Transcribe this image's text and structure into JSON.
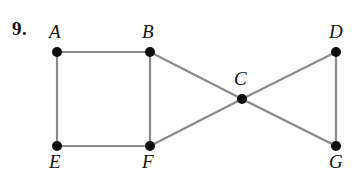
{
  "problem": {
    "number_label": "9."
  },
  "figure": {
    "type": "undirected-graph",
    "background_color": "#ffffff",
    "edge_color": "#8a8a8a",
    "vertex_color": "#0d0d0d",
    "label_color": "#111111",
    "vertex_radius": 5,
    "vertices": [
      {
        "id": "A",
        "label": "A",
        "x": 57,
        "y": 52,
        "label_x": 49,
        "label_y": 38
      },
      {
        "id": "B",
        "label": "B",
        "x": 150,
        "y": 52,
        "label_x": 142,
        "label_y": 38
      },
      {
        "id": "C",
        "label": "C",
        "x": 242,
        "y": 99,
        "label_x": 234,
        "label_y": 85
      },
      {
        "id": "D",
        "label": "D",
        "x": 336,
        "y": 52,
        "label_x": 329,
        "label_y": 38
      },
      {
        "id": "E",
        "label": "E",
        "x": 57,
        "y": 146,
        "label_x": 49,
        "label_y": 168
      },
      {
        "id": "F",
        "label": "F",
        "x": 150,
        "y": 146,
        "label_x": 142,
        "label_y": 168
      },
      {
        "id": "G",
        "label": "G",
        "x": 336,
        "y": 146,
        "label_x": 329,
        "label_y": 168
      }
    ],
    "edges": [
      {
        "from": "A",
        "to": "B"
      },
      {
        "from": "A",
        "to": "E"
      },
      {
        "from": "B",
        "to": "F"
      },
      {
        "from": "E",
        "to": "F"
      },
      {
        "from": "B",
        "to": "C"
      },
      {
        "from": "C",
        "to": "G"
      },
      {
        "from": "F",
        "to": "C"
      },
      {
        "from": "C",
        "to": "D"
      },
      {
        "from": "D",
        "to": "G"
      }
    ]
  }
}
